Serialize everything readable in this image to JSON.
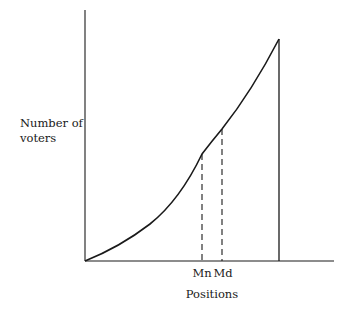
{
  "figure": {
    "ylabel_line1": "Number of",
    "ylabel_line2": "voters",
    "xlabel": "Positions",
    "markers": {
      "mean": "Mn",
      "median": "Md"
    }
  },
  "colors": {
    "ink": "#1a1a1a",
    "background": "#ffffff"
  }
}
